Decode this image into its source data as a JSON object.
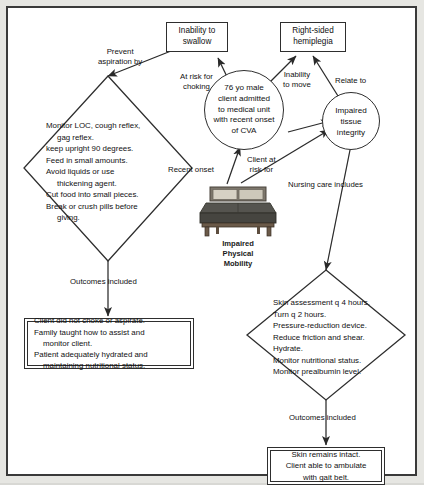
{
  "diagram": {
    "colors": {
      "page_background": "#e6e6e2",
      "frame_border": "#3a3a3a",
      "node_border": "#2e2e2e",
      "text": "#111111",
      "bed_mattress": "#4b4b4b",
      "bed_pillow": "#cfcabc",
      "bed_frame": "#6b5a49"
    }
  },
  "nodes": {
    "box_swallow": {
      "lines": [
        "Inability to",
        "swallow"
      ]
    },
    "box_hemiplegia": {
      "lines": [
        "Right-sided",
        "hemiplegia"
      ]
    },
    "circle_patient": {
      "lines": [
        "76 yo male",
        "client admitted",
        "to medical unit",
        "with recent onset",
        "of CVA"
      ]
    },
    "circle_tissue": {
      "lines": [
        "Impaired",
        "tissue",
        "integrity"
      ]
    },
    "bed": {
      "caption": [
        "Impaired",
        "Physical",
        "Mobility"
      ],
      "icon": "hospital-bed-icon"
    },
    "diamond_aspiration": {
      "lines": [
        {
          "text": "Monitor LOC, cough reflex,",
          "indent": false
        },
        {
          "text": "gag reflex.",
          "indent": true
        },
        {
          "text": "keep upright 90 degrees.",
          "indent": false
        },
        {
          "text": "Feed in small amounts.",
          "indent": false
        },
        {
          "text": "Avoid liquids or use",
          "indent": false
        },
        {
          "text": "thickening agent.",
          "indent": true
        },
        {
          "text": "Cut food into small pieces.",
          "indent": false
        },
        {
          "text": "Break or crush pills before",
          "indent": false
        },
        {
          "text": "giving.",
          "indent": true
        }
      ]
    },
    "diamond_skin": {
      "lines": [
        {
          "text": "Skin assessment q 4 hours.",
          "indent": false
        },
        {
          "text": "Turn q 2 hours.",
          "indent": false
        },
        {
          "text": "Pressure-reduction device.",
          "indent": false
        },
        {
          "text": "Reduce friction and shear.",
          "indent": false
        },
        {
          "text": "Hydrate.",
          "indent": false
        },
        {
          "text": "Monitor nutritional status.",
          "indent": false
        },
        {
          "text": "Monitor prealbumin level.",
          "indent": false
        }
      ]
    },
    "outcomes_box_left": {
      "lines": [
        {
          "text": "Client did not choke or aspirate.",
          "indent": false
        },
        {
          "text": "Family taught how to assist and",
          "indent": false
        },
        {
          "text": "monitor client.",
          "indent": true
        },
        {
          "text": "Patient adequately hydrated and",
          "indent": false
        },
        {
          "text": "maintaining nutritional status.",
          "indent": true
        }
      ]
    },
    "outcomes_box_right": {
      "lines": [
        {
          "text": "Skin remains intact.",
          "indent": false
        },
        {
          "text": "Client able to ambulate",
          "indent": false
        },
        {
          "text": "with gait belt.",
          "indent": false
        }
      ]
    }
  },
  "connector_labels": {
    "prevent_aspiration": [
      "Prevent",
      "aspiration by"
    ],
    "at_risk_choking": [
      "At risk for",
      "choking"
    ],
    "inability_to_move": [
      "Inability",
      "to move"
    ],
    "relate_to": [
      "Relate to"
    ],
    "recent_onset": [
      "Recent onset"
    ],
    "client_at_risk_for": [
      "Client at",
      "risk for"
    ],
    "nursing_care_includes": [
      "Nursing care includes"
    ],
    "outcomes_included_left": [
      "Outcomes included"
    ],
    "outcomes_included_right": [
      "Outcomes included"
    ]
  }
}
